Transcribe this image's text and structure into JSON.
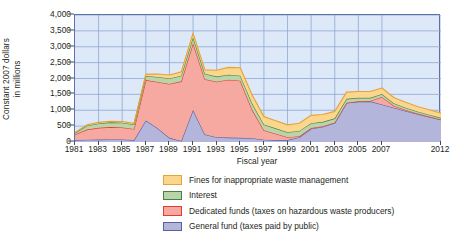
{
  "chart_data": {
    "type": "area",
    "stacked": true,
    "title": "",
    "xlabel": "Fiscal year",
    "ylabel": "Constant 2007 dollars in millions",
    "ylabel_line1": "Constant 2007 dollars",
    "ylabel_line2": "in millions",
    "ylim": [
      0,
      4000
    ],
    "ytick_step": 500,
    "ytick_labels": [
      "0",
      "500",
      "1,000",
      "1,500",
      "2,000",
      "2,500",
      "3,000",
      "3,500",
      "4,000"
    ],
    "ytick_values": [
      0,
      500,
      1000,
      1500,
      2000,
      2500,
      3000,
      3500,
      4000
    ],
    "xlim": [
      1981,
      2012
    ],
    "xtick_labels": [
      "1981",
      "1983",
      "1985",
      "1987",
      "1989",
      "1991",
      "1993",
      "1995",
      "1997",
      "1999",
      "2001",
      "2003",
      "2005",
      "2007",
      "2012"
    ],
    "xtick_values": [
      1981,
      1983,
      1985,
      1987,
      1989,
      1991,
      1993,
      1995,
      1997,
      1999,
      2001,
      2003,
      2005,
      2007,
      2012
    ],
    "grid": true,
    "grid_color": "#8fa8d0",
    "plot_background": "#dde8f8",
    "legend_position": "below",
    "x": [
      1981,
      1982,
      1983,
      1984,
      1985,
      1986,
      1987,
      1988,
      1989,
      1990,
      1991,
      1992,
      1993,
      1994,
      1995,
      1996,
      1997,
      1998,
      1999,
      2000,
      2001,
      2002,
      2003,
      2004,
      2005,
      2006,
      2007,
      2008,
      2009,
      2010,
      2011,
      2012
    ],
    "series": [
      {
        "name": "General fund (taxes paid by public)",
        "key": "general_fund",
        "fill": "#b3b6da",
        "stroke": "#5b5ea0",
        "values": [
          60,
          70,
          75,
          80,
          80,
          60,
          680,
          430,
          130,
          30,
          1010,
          240,
          150,
          140,
          130,
          120,
          70,
          60,
          60,
          150,
          420,
          480,
          600,
          1230,
          1270,
          1280,
          1180,
          1080,
          980,
          880,
          790,
          700
        ]
      },
      {
        "name": "Dedicated funds (taxes on hazardous waste producers)",
        "key": "dedicated_funds",
        "fill": "#f6a9a1",
        "stroke": "#e43b2d",
        "values": [
          180,
          320,
          370,
          390,
          380,
          350,
          1270,
          1460,
          1700,
          1880,
          2100,
          1740,
          1750,
          1820,
          1800,
          900,
          300,
          200,
          90,
          30,
          20,
          15,
          15,
          10,
          10,
          10,
          240,
          60,
          30,
          20,
          15,
          10
        ]
      },
      {
        "name": "Interest",
        "key": "interest",
        "fill": "#b9d4a9",
        "stroke": "#4d7e41",
        "values": [
          40,
          120,
          140,
          150,
          150,
          140,
          130,
          160,
          170,
          180,
          190,
          170,
          160,
          160,
          160,
          200,
          180,
          170,
          160,
          170,
          150,
          140,
          130,
          120,
          110,
          100,
          90,
          80,
          70,
          60,
          55,
          50
        ]
      },
      {
        "name": "Fines for inappropriate waste management",
        "key": "fines",
        "fill": "#fad78c",
        "stroke": "#e7a33a",
        "values": [
          20,
          30,
          35,
          35,
          35,
          35,
          60,
          90,
          110,
          120,
          130,
          120,
          200,
          230,
          250,
          260,
          250,
          240,
          230,
          240,
          250,
          230,
          220,
          210,
          200,
          200,
          190,
          180,
          170,
          160,
          155,
          150
        ]
      }
    ],
    "stack_order_bottom_to_top": [
      "general_fund",
      "dedicated_funds",
      "interest",
      "fines"
    ],
    "totals": [
      300,
      540,
      620,
      655,
      645,
      585,
      2140,
      2140,
      2110,
      2210,
      3430,
      2270,
      2260,
      2350,
      2340,
      1480,
      800,
      670,
      540,
      590,
      840,
      865,
      965,
      1570,
      1590,
      1590,
      1700,
      1400,
      1250,
      1120,
      1015,
      910
    ]
  },
  "legend": {
    "items": [
      {
        "label": "Fines for inappropriate waste management",
        "fill": "#fad78c",
        "stroke": "#e7a33a"
      },
      {
        "label": "Interest",
        "fill": "#b9d4a9",
        "stroke": "#4d7e41"
      },
      {
        "label": "Dedicated funds (taxes on hazardous waste producers)",
        "fill": "#f6a9a1",
        "stroke": "#e43b2d"
      },
      {
        "label": "General fund (taxes paid by public)",
        "fill": "#b3b6da",
        "stroke": "#5b5ea0"
      }
    ]
  }
}
